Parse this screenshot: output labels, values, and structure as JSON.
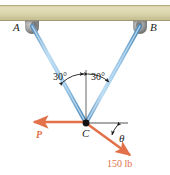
{
  "figure": {
    "type": "statics-free-body-diagram",
    "labels": {
      "support_a": "A",
      "support_b": "B",
      "joint_c": "C",
      "angle_left": "30°",
      "angle_right": "30°",
      "angle_theta": "θ",
      "force_p": "P",
      "load_value": "150 lb"
    },
    "colors": {
      "beam_fill": "#d9d4a8",
      "beam_edge": "#b3ad7d",
      "support_block": "#9a9a9a",
      "cable": "#9cc7e8",
      "cable_edge": "#4b86b4",
      "force_arrow": "#e2714a",
      "reference_line": "#555555",
      "joint_dot": "#111111",
      "text": "#1a1a1a"
    },
    "geometry": {
      "beam": {
        "x": 0,
        "y": 5,
        "width": 170,
        "height": 16
      },
      "support_a": {
        "cx": 32,
        "cy": 24
      },
      "support_b": {
        "cx": 140,
        "cy": 24
      },
      "joint_c": {
        "cx": 86,
        "cy": 123
      },
      "vertical_reference": {
        "x": 86,
        "y_top": 70,
        "y_bottom": 123
      },
      "horizontal_reference": {
        "x_start": 86,
        "x_end": 128,
        "y": 123
      },
      "cable_ac_angle_deg": 30,
      "cable_bc_angle_deg": 30,
      "force_p_tip": {
        "x": 30,
        "y": 122
      },
      "load_tip": {
        "x": 132,
        "y": 157
      }
    }
  }
}
